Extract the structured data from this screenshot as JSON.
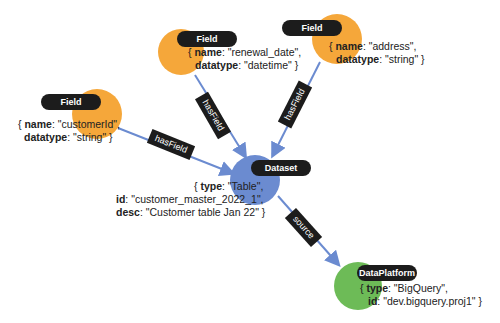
{
  "colors": {
    "field": "#f5a73a",
    "dataset": "#6b8bd0",
    "dataplatform": "#6dbb57",
    "edge": "#6b8bd0",
    "label_bg": "#1c1c1c"
  },
  "nodes": {
    "field_customerid": {
      "type_label": "Field",
      "props": [
        {
          "key": "name",
          "value": ": \"customerId\","
        },
        {
          "key": "datatype",
          "value": ": \"string\" }"
        }
      ]
    },
    "field_renewal": {
      "type_label": "Field",
      "props": [
        {
          "key": "name",
          "value": ": \"renewal_date\","
        },
        {
          "key": "datatype",
          "value": ": \"datetime\" }"
        }
      ]
    },
    "field_address": {
      "type_label": "Field",
      "props": [
        {
          "key": "name",
          "value": ": \"address\","
        },
        {
          "key": "datatype",
          "value": ": \"string\" }"
        }
      ]
    },
    "dataset": {
      "type_label": "Dataset",
      "props": [
        {
          "key": "type",
          "value": ": \"Table\","
        },
        {
          "key": "id",
          "value": ": \"customer_master_2022_1\","
        },
        {
          "key": "desc",
          "value": ": \"Customer table Jan 22\" }"
        }
      ]
    },
    "dataplatform": {
      "type_label": "DataPlatform",
      "props": [
        {
          "key": "type",
          "value": ": \"BigQuery\","
        },
        {
          "key": "id",
          "value": ": \"dev.bigquery.proj1\" }"
        }
      ]
    }
  },
  "edges": [
    {
      "from": "field_customerid",
      "to": "dataset",
      "label": "hasField"
    },
    {
      "from": "field_renewal",
      "to": "dataset",
      "label": "hasField"
    },
    {
      "from": "field_address",
      "to": "dataset",
      "label": "hasField"
    },
    {
      "from": "dataset",
      "to": "dataplatform",
      "label": "source"
    }
  ]
}
